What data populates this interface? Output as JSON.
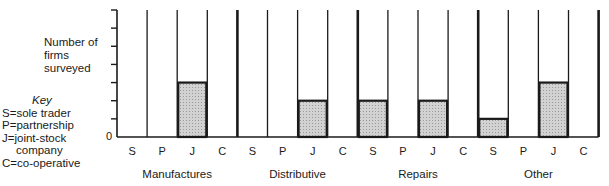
{
  "chart_data": {
    "type": "bar",
    "title": "",
    "ylabel": "Number of firms surveyed",
    "xlabel": "",
    "ylim": [
      0,
      7
    ],
    "y_ticks": [
      0,
      1,
      2,
      3,
      4,
      5,
      6,
      7
    ],
    "y_tick_labels_shown": [
      "0"
    ],
    "grid": false,
    "groups": [
      "Manufactures",
      "Distributive",
      "Repairs",
      "Other"
    ],
    "categories": [
      "S",
      "P",
      "J",
      "C"
    ],
    "series": [
      {
        "name": "Manufactures",
        "values": [
          0,
          0,
          3,
          0
        ]
      },
      {
        "name": "Distributive",
        "values": [
          0,
          0,
          2,
          0
        ]
      },
      {
        "name": "Repairs",
        "values": [
          2,
          0,
          2,
          0
        ]
      },
      {
        "name": "Other",
        "values": [
          1,
          0,
          3,
          0
        ]
      }
    ],
    "legend": {
      "title": "Key",
      "position": "left",
      "entries": [
        {
          "code": "S",
          "label": "sole trader"
        },
        {
          "code": "P",
          "label": "partnership"
        },
        {
          "code": "J",
          "label": "joint-stock company"
        },
        {
          "code": "C",
          "label": "co-operative"
        }
      ]
    },
    "bar_fill": "#c8c8c8",
    "line_color": "#1a1a1a"
  },
  "labels": {
    "ylabel_lines": [
      "Number of",
      "firms",
      "surveyed"
    ],
    "zero": "0",
    "key_title": "Key",
    "key_lines": [
      "S=sole trader",
      "P=partnership",
      "J=joint-stock",
      "company",
      "C=co-operative"
    ]
  }
}
